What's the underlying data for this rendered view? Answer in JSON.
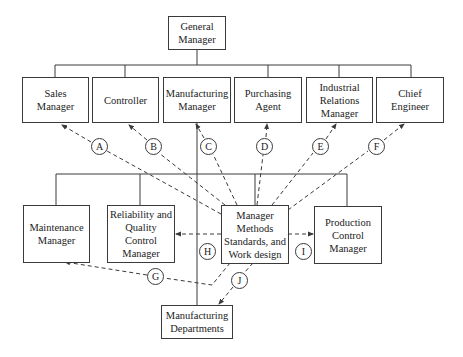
{
  "diagram": {
    "type": "organization-chart",
    "nodes": {
      "general_manager": "General\nManager",
      "sales_manager": "Sales\nManager",
      "controller": "Controller",
      "manufacturing_manager": "Manufacturing\nManager",
      "purchasing_agent": "Purchasing\nAgent",
      "industrial_relations_manager": "Industrial\nRelations\nManager",
      "chief_engineer": "Chief\nEngineer",
      "maintenance_manager": "Maintenance\nManager",
      "reliability_quality_control_manager": "Reliability and\nQuality\nControl\nManager",
      "methods_standards_manager": "Manager\nMethods\nStandards, and\nWork design",
      "production_control_manager": "Production\nControl\nManager",
      "manufacturing_departments": "Manufacturing\nDepartments"
    },
    "relationship_labels": {
      "A": "A",
      "B": "B",
      "C": "C",
      "D": "D",
      "E": "E",
      "F": "F",
      "G": "G",
      "H": "H",
      "I": "I",
      "J": "J"
    },
    "solid_lines_meaning": "line authority",
    "dashed_lines_meaning": "functional relationships from Methods, Standards, and Work Design manager",
    "dashed_links": [
      {
        "label": "A",
        "from": "methods_standards_manager",
        "to": "sales_manager"
      },
      {
        "label": "B",
        "from": "methods_standards_manager",
        "to": "controller"
      },
      {
        "label": "C",
        "from": "methods_standards_manager",
        "to": "manufacturing_manager"
      },
      {
        "label": "D",
        "from": "methods_standards_manager",
        "to": "purchasing_agent"
      },
      {
        "label": "E",
        "from": "methods_standards_manager",
        "to": "industrial_relations_manager"
      },
      {
        "label": "F",
        "from": "methods_standards_manager",
        "to": "chief_engineer"
      },
      {
        "label": "G",
        "from": "methods_standards_manager",
        "to": "maintenance_manager"
      },
      {
        "label": "H",
        "from": "methods_standards_manager",
        "to": "reliability_quality_control_manager"
      },
      {
        "label": "I",
        "from": "methods_standards_manager",
        "to": "production_control_manager"
      },
      {
        "label": "J",
        "from": "methods_standards_manager",
        "to": "manufacturing_departments"
      }
    ],
    "colors": {
      "line": "#3a3a3a",
      "text": "#222222",
      "background": "#ffffff"
    }
  }
}
